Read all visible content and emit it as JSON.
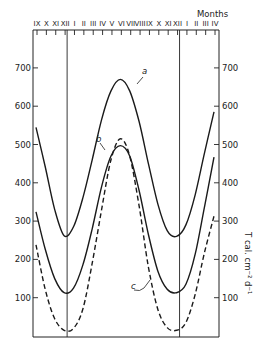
{
  "chart_data": {
    "type": "line",
    "title": "",
    "xlabel": "Months",
    "ylabel_right": "T cal. cm⁻² d⁻¹",
    "ylim": [
      0,
      780
    ],
    "yticks": [
      100,
      200,
      300,
      400,
      500,
      600,
      700
    ],
    "y_tick_labels_left": [
      "100",
      "200",
      "300",
      "400",
      "500",
      "600",
      "700"
    ],
    "y_tick_labels_right": [
      "100",
      "200",
      "300",
      "400",
      "500",
      "600",
      "700"
    ],
    "categories": [
      "IX",
      "X",
      "XI",
      "XII",
      "I",
      "II",
      "III",
      "IV",
      "V",
      "VI",
      "VII",
      "VIII",
      "IX",
      "X",
      "XI",
      "XII",
      "I",
      "II",
      "III",
      "IV"
    ],
    "vertical_markers_after": [
      "XII",
      "XII"
    ],
    "grid": false,
    "series": [
      {
        "name": "a",
        "style": "solid",
        "values": [
          545,
          440,
          330,
          262,
          285,
          360,
          460,
          565,
          640,
          670,
          640,
          560,
          450,
          345,
          275,
          260,
          290,
          370,
          480,
          585
        ]
      },
      {
        "name": "b",
        "style": "solid",
        "values": [
          324,
          225,
          150,
          113,
          125,
          185,
          280,
          390,
          470,
          497,
          470,
          380,
          265,
          170,
          122,
          113,
          135,
          215,
          340,
          467
        ]
      },
      {
        "name": "c",
        "style": "dashed",
        "values": [
          238,
          120,
          45,
          15,
          20,
          70,
          190,
          330,
          460,
          515,
          470,
          340,
          180,
          70,
          22,
          15,
          35,
          110,
          220,
          313
        ]
      }
    ]
  },
  "labels": {
    "months_title": "Months",
    "right_axis_title": "T cal. cm⁻² d⁻¹",
    "curve_a": "a",
    "curve_b": "b",
    "curve_c": "c"
  }
}
